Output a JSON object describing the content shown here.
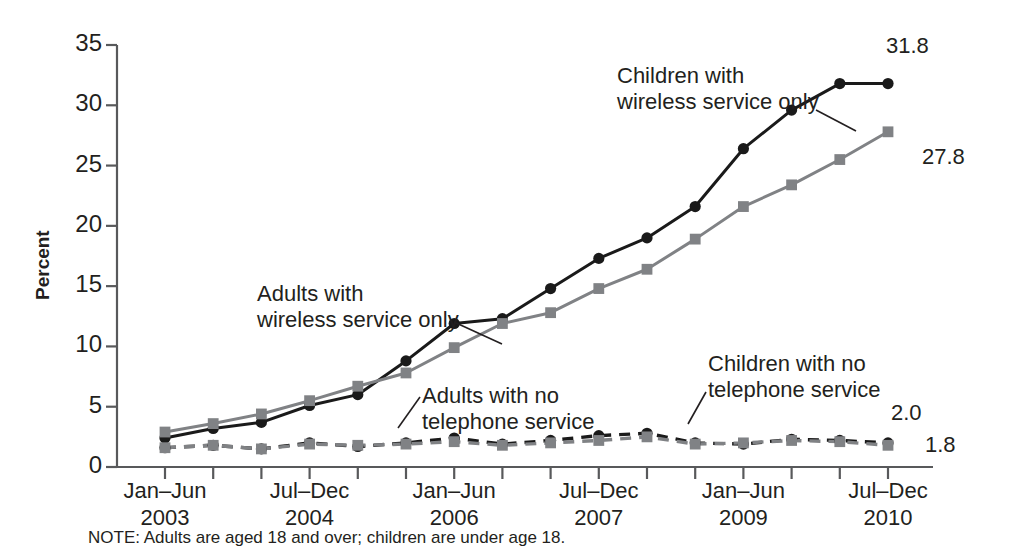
{
  "figure": {
    "note": "NOTE: Adults are aged 18 and over; children are under age 18."
  },
  "axes": {
    "ylabel": "Percent",
    "yticks": [
      "0",
      "5",
      "10",
      "15",
      "20",
      "25",
      "30",
      "35"
    ],
    "xticklabels": [
      {
        "period": "Jan–Jun",
        "year": "2003"
      },
      {
        "period": "Jul–Dec",
        "year": "2004"
      },
      {
        "period": "Jan–Jun",
        "year": "2006"
      },
      {
        "period": "Jul–Dec",
        "year": "2007"
      },
      {
        "period": "Jan–Jun",
        "year": "2009"
      },
      {
        "period": "Jul–Dec",
        "year": "2010"
      }
    ]
  },
  "annotations": [
    {
      "id": "children-wireless",
      "line1": "Children with",
      "line2": "wireless service only"
    },
    {
      "id": "adults-wireless",
      "line1": "Adults with",
      "line2": "wireless service only"
    },
    {
      "id": "adults-no-phone",
      "line1": "Adults with no",
      "line2": "telephone service"
    },
    {
      "id": "children-no-phone",
      "line1": "Children with no",
      "line2": "telephone service"
    }
  ],
  "endpoint_labels": [
    {
      "id": "children-wireless-end",
      "text": "31.8"
    },
    {
      "id": "adults-wireless-end",
      "text": "27.8"
    },
    {
      "id": "children-no-phone-end",
      "text": "2.0"
    },
    {
      "id": "adults-no-phone-end",
      "text": "1.8"
    }
  ],
  "colors": {
    "children_series": "#1a1a1a",
    "adults_series": "#808285",
    "axis": "#58595b",
    "text": "#231f20",
    "background": "#ffffff"
  },
  "chart_data": {
    "type": "line",
    "title": "",
    "xlabel": "",
    "ylabel": "Percent",
    "ylim": [
      0,
      35
    ],
    "grid": false,
    "legend": "annotations on plot",
    "x": [
      "Jan–Jun 2003",
      "Jul–Dec 2003",
      "Jan–Jun 2004",
      "Jul–Dec 2004",
      "Jan–Jun 2005",
      "Jul–Dec 2005",
      "Jan–Jun 2006",
      "Jul–Dec 2006",
      "Jan–Jun 2007",
      "Jul–Dec 2007",
      "Jan–Jun 2008",
      "Jul–Dec 2008",
      "Jan–Jun 2009",
      "Jul–Dec 2009",
      "Jan–Jun 2010",
      "Jul–Dec 2010"
    ],
    "xtick_positions": [
      0,
      3,
      6,
      9,
      12,
      15
    ],
    "series": [
      {
        "name": "Children with wireless service only",
        "marker": "circle",
        "linestyle": "solid",
        "color": "#1a1a1a",
        "values": [
          2.4,
          3.2,
          3.7,
          5.1,
          6.0,
          8.8,
          11.9,
          12.3,
          14.8,
          17.3,
          19.0,
          21.6,
          26.4,
          29.6,
          31.8,
          31.8
        ]
      },
      {
        "name": "Adults with wireless service only",
        "marker": "square",
        "linestyle": "solid",
        "color": "#808285",
        "values": [
          2.9,
          3.6,
          4.4,
          5.5,
          6.7,
          7.8,
          9.9,
          11.9,
          12.8,
          14.8,
          16.4,
          18.9,
          21.6,
          23.4,
          25.5,
          27.8
        ]
      },
      {
        "name": "Children with no telephone service",
        "marker": "circle",
        "linestyle": "dashed",
        "color": "#1a1a1a",
        "values": [
          1.6,
          1.8,
          1.5,
          2.0,
          1.7,
          2.0,
          2.4,
          1.9,
          2.2,
          2.6,
          2.8,
          2.0,
          1.9,
          2.3,
          2.2,
          2.0
        ]
      },
      {
        "name": "Adults with no telephone service",
        "marker": "square",
        "linestyle": "dashed",
        "color": "#808285",
        "values": [
          1.6,
          1.8,
          1.5,
          1.9,
          1.8,
          1.9,
          2.1,
          1.8,
          2.0,
          2.2,
          2.5,
          1.9,
          2.0,
          2.2,
          2.1,
          1.8
        ]
      }
    ],
    "endpoint_annotations": [
      {
        "series": "Children with wireless service only",
        "value": 31.8
      },
      {
        "series": "Adults with wireless service only",
        "value": 27.8
      },
      {
        "series": "Children with no telephone service",
        "value": 2.0
      },
      {
        "series": "Adults with no telephone service",
        "value": 1.8
      }
    ]
  }
}
